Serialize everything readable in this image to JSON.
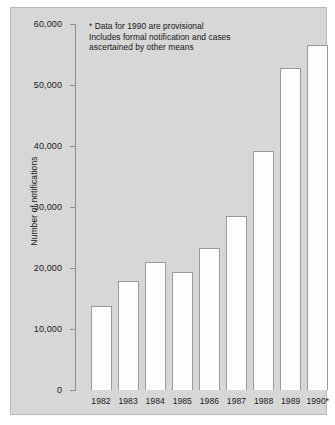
{
  "chart_data": {
    "type": "bar",
    "title": "",
    "xlabel": "",
    "ylabel": "Number of notifications",
    "ylim": [
      0,
      60000
    ],
    "grid": false,
    "legend": null,
    "categories": [
      "1982",
      "1983",
      "1984",
      "1985",
      "1986",
      "1987",
      "1988",
      "1989",
      "1990*"
    ],
    "values": [
      13800,
      17900,
      21000,
      19300,
      23300,
      28500,
      39200,
      52800,
      56500
    ],
    "ytick_labels": [
      "0",
      "10,000",
      "20,000",
      "30,000",
      "40,000",
      "50,000",
      "60,000"
    ],
    "ytick_values": [
      0,
      10000,
      20000,
      30000,
      40000,
      50000,
      60000
    ],
    "annotations": [
      "* Data for 1990 are provisional",
      "Includes formal notification and cases",
      "ascertained by other means"
    ],
    "colors": {
      "background": "#d7d7d7",
      "bar_fill": "#fdfdfd",
      "bar_edge": "#9a9a9a",
      "axis": "#8c8c8c",
      "text": "#1a1a1a"
    }
  }
}
